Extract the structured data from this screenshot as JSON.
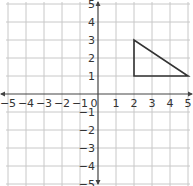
{
  "chart_data": {
    "type": "line",
    "title": "",
    "xlabel": "",
    "ylabel": "",
    "xlim": [
      -5,
      5
    ],
    "ylim": [
      -5,
      5
    ],
    "grid": true,
    "x_ticks": [
      "−5",
      "−4",
      "−3",
      "−2",
      "−1",
      "0",
      "1",
      "2",
      "3",
      "4",
      "5"
    ],
    "y_ticks": [
      "−5",
      "−4",
      "−3",
      "−2",
      "−1",
      "1",
      "2",
      "3",
      "4",
      "5"
    ],
    "series": [
      {
        "name": "triangle",
        "closed": true,
        "points": [
          [
            2,
            1
          ],
          [
            2,
            3
          ],
          [
            5,
            1
          ]
        ],
        "color": "#333333"
      }
    ]
  },
  "colors": {
    "grid": "#c8c8c8",
    "axis": "#444444",
    "shape": "#333333"
  }
}
